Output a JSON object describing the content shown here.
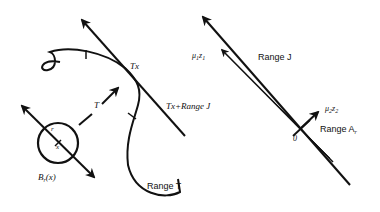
{
  "left_panel": {
    "tx_label": "Tx",
    "tangent_label": "Tx+Range J",
    "map_label": "T",
    "range_label": "Range T",
    "ball_label": "B",
    "ball_sub": "r",
    "ball_arg": "(x)",
    "radius_label": "r",
    "center_label": "x"
  },
  "right_panel": {
    "range_j_label": "Range J",
    "mu1_label": "μ",
    "mu1_sub": "1",
    "z1_label": "z",
    "z1_sub": "1",
    "mu2_label": "μ",
    "mu2_sub": "2",
    "z2_label": "z",
    "z2_sub": "2",
    "range_a_label": "Range A",
    "range_a_sub": "r",
    "origin_label": "0"
  },
  "colors": {
    "stroke": "#111111",
    "background": "#ffffff"
  }
}
